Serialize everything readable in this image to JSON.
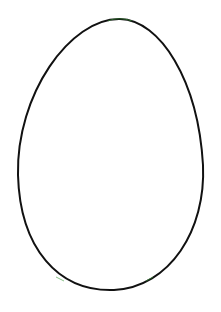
{
  "drawing": {
    "subject": "egg-outline",
    "background": "#ffffff",
    "stroke_color": "#111111",
    "accent_color": "#3a9a3a",
    "stroke_width": 2
  }
}
